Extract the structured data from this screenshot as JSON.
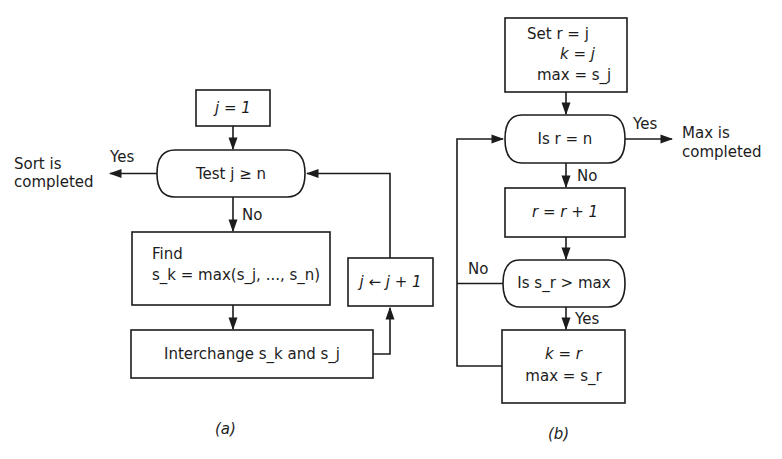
{
  "diagram_a": {
    "caption": "(a)",
    "start_box": {
      "label": "j = 1"
    },
    "test_node": {
      "label": "Test j ≥ n"
    },
    "yes_label": "Yes",
    "no_label": "No",
    "exit_text": {
      "line1": "Sort is",
      "line2": "completed"
    },
    "find_box": {
      "line1": "Find",
      "line2": "s_k = max(s_j, ..., s_n)"
    },
    "interchange_box": {
      "label": "Interchange s_k and s_j"
    },
    "increment_box": {
      "label": "j ← j + 1"
    }
  },
  "diagram_b": {
    "caption": "(b)",
    "set_box": {
      "line1": "Set r = j",
      "line2": "k = j",
      "line3": "max = s_j"
    },
    "test_rn": {
      "label": "Is r = n"
    },
    "yes_label_top": "Yes",
    "exit_text": {
      "line1": "Max is",
      "line2": "completed"
    },
    "no_label_top": "No",
    "increment_box": {
      "label": "r = r + 1"
    },
    "test_sr": {
      "label": "Is s_r > max"
    },
    "no_label_left": "No",
    "yes_label_bottom": "Yes",
    "update_box": {
      "line1": "k = r",
      "line2": "max = s_r"
    }
  }
}
